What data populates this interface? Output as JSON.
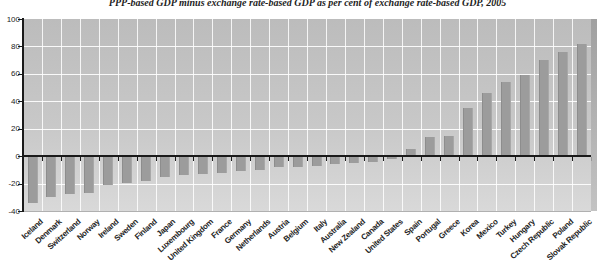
{
  "title": "PPP-based GDP minus exchange rate-based GDP as per cent of exchange rate-based GDP, 2005",
  "chart_data": {
    "type": "bar",
    "title": "PPP-based GDP minus exchange rate-based GDP as per cent of exchange rate-based GDP, 2005",
    "xlabel": "",
    "ylabel": "",
    "categories": [
      "Iceland",
      "Denmark",
      "Switzerland",
      "Norway",
      "Ireland",
      "Sweden",
      "Finland",
      "Japan",
      "Luxembourg",
      "United Kingdom",
      "France",
      "Germany",
      "Netherlands",
      "Austria",
      "Belgium",
      "Italy",
      "Australia",
      "New Zealand",
      "Canada",
      "United States",
      "Spain",
      "Portugal",
      "Greece",
      "Korea",
      "Mexico",
      "Turkey",
      "Hungary",
      "Czech Republic",
      "Poland",
      "Slovak Republic"
    ],
    "values": [
      -34,
      -30,
      -28,
      -27,
      -21,
      -20,
      -18,
      -15,
      -14,
      -13,
      -12,
      -11,
      -10,
      -8,
      -8,
      -7,
      -6,
      -5,
      -4,
      -2,
      5,
      14,
      15,
      35,
      46,
      54,
      59,
      70,
      76,
      82
    ],
    "ylim": [
      -40,
      100
    ],
    "ytick_step": 20,
    "grid": true,
    "legend": "none",
    "bar_color": "#9c9c9c",
    "plot_bg_top": "#bcbcbc",
    "plot_bg_bottom": "#d9d9d9",
    "gridline_color": "#ffffff",
    "axis_color": "#1a1a1a",
    "page_edge_shadow_color": "#999999"
  }
}
